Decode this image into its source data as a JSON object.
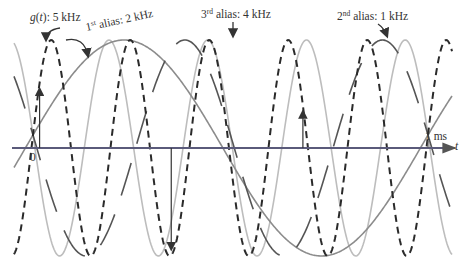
{
  "figure": {
    "axis": {
      "t_label": "t",
      "origin_label": "0",
      "end_label": "1 ms",
      "origin_px": 33,
      "end_px": 428,
      "axis_y": 148,
      "amplitude_px": 108
    },
    "labels": {
      "g": {
        "prefix": "g",
        "paren_open": "(",
        "var": "t",
        "paren_close": ")",
        "rest": ": 5 kHz"
      },
      "alias1": {
        "num": "1",
        "sup": "st",
        "rest": " alias: 2 kHz"
      },
      "alias2": {
        "num": "2",
        "sup": "nd",
        "rest": " alias: 1 kHz"
      },
      "alias3": {
        "num": "3",
        "sup": "rd",
        "rest": " alias: 4 kHz"
      }
    },
    "signals": [
      {
        "name": "g(t)",
        "freq_khz": 5,
        "style": "dashed",
        "color": "#2a2a2a"
      },
      {
        "name": "1st alias",
        "freq_khz": 2,
        "style": "long-dash",
        "color": "#4a4a4a"
      },
      {
        "name": "2nd alias",
        "freq_khz": 1,
        "style": "solid",
        "color": "#8a8a8a"
      },
      {
        "name": "3rd alias",
        "freq_khz": 4,
        "style": "solid",
        "color": "#b8b8b8"
      }
    ],
    "sampling_rate_khz": 3,
    "sample_times_ms": [
      0.0167,
      0.35,
      0.6833
    ]
  }
}
